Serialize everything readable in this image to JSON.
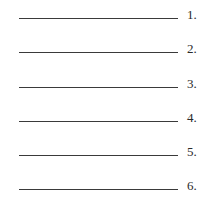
{
  "answer_blanks": [
    {
      "number": "1.",
      "value": ""
    },
    {
      "number": "2.",
      "value": ""
    },
    {
      "number": "3.",
      "value": ""
    },
    {
      "number": "4.",
      "value": ""
    },
    {
      "number": "5.",
      "value": ""
    },
    {
      "number": "6.",
      "value": ""
    }
  ],
  "colors": {
    "line": "#3a3a3a",
    "text": "#2a2a2a",
    "background": "#ffffff"
  }
}
